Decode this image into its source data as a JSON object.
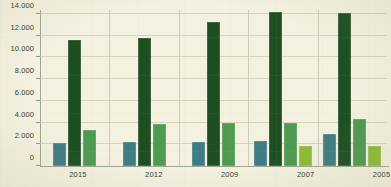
{
  "chart_data": {
    "type": "bar",
    "title": "",
    "subtitle": "",
    "xlabel": "",
    "ylabel": "",
    "categories": [
      "2015",
      "2012",
      "2009",
      "2007",
      "2005"
    ],
    "ylim": [
      0,
      14000
    ],
    "y_ticks": [
      0,
      2000,
      4000,
      6000,
      8000,
      10000,
      12000,
      14000
    ],
    "y_tick_labels": [
      "0",
      "2.000",
      "4.000",
      "6.000",
      "8.000",
      "10.000",
      "12.000",
      "14.000"
    ],
    "grid": true,
    "legend": "none",
    "orientation": "vertical",
    "series": [
      {
        "name": "series-1",
        "color": "#3f7c84",
        "values": [
          2100,
          2250,
          2250,
          2350,
          2950
        ]
      },
      {
        "name": "series-2",
        "color": "#1d4f22",
        "values": [
          11650,
          11800,
          13300,
          14200,
          14100
        ]
      },
      {
        "name": "series-3",
        "color": "#4f9a51",
        "values": [
          3300,
          3900,
          4000,
          3980,
          4350
        ]
      },
      {
        "name": "series-4",
        "color": "#8dbb36",
        "values": [
          null,
          null,
          null,
          1800,
          1850
        ]
      }
    ]
  },
  "colors": {
    "background": "#f4f1e0",
    "axis": "#8f9a86",
    "gridline": "#c9cbb2",
    "text": "#2f3d2c",
    "series_1": "#3f7c84",
    "series_2": "#1d4f22",
    "series_3": "#4f9a51",
    "series_4": "#8dbb36"
  }
}
